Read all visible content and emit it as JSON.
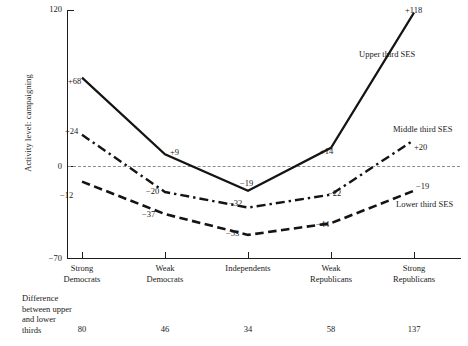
{
  "chart_data": {
    "type": "line",
    "title": "",
    "xlabel": "",
    "ylabel": "Activity level: campaigning",
    "ylim": [
      -70,
      120
    ],
    "yticks": [
      "120",
      "0",
      "−70"
    ],
    "grid": false,
    "zero_reference_line": true,
    "legend_position": "right-inline",
    "categories": [
      "Strong Democrats",
      "Weak Democrats",
      "Independents",
      "Weak Republicans",
      "Strong Republicans"
    ],
    "category_lines": [
      [
        "Strong",
        "Democrats"
      ],
      [
        "Weak",
        "Democrats"
      ],
      [
        "Independents",
        ""
      ],
      [
        "Weak",
        "Republicans"
      ],
      [
        "Strong",
        "Republicans"
      ]
    ],
    "series": [
      {
        "name": "Upper third SES",
        "style": "solid",
        "values": [
          68,
          9,
          -19,
          14,
          118
        ],
        "labels": [
          "+68",
          "+9",
          "−19",
          "+14",
          "+118"
        ]
      },
      {
        "name": "Middle third SES",
        "style": "dash-dot",
        "values": [
          24,
          -20,
          -32,
          -22,
          20
        ],
        "labels": [
          "+24",
          "−20",
          "−32",
          "−22",
          "+20"
        ]
      },
      {
        "name": "Lower third SES",
        "style": "dashed",
        "values": [
          -12,
          -37,
          -53,
          -44,
          -19
        ],
        "labels": [
          "−12",
          "−37",
          "−53",
          "−44",
          "−19"
        ]
      }
    ],
    "footer": {
      "label_lines": [
        "Difference",
        "between upper",
        "and lower",
        "thirds"
      ],
      "values": [
        "80",
        "46",
        "34",
        "58",
        "137"
      ]
    },
    "colors": {
      "line": "#141414",
      "axis": "#1d1d1d",
      "zero_line": "#8d8d8d",
      "background": "#ffffff",
      "text": "#1a1a1a"
    }
  }
}
